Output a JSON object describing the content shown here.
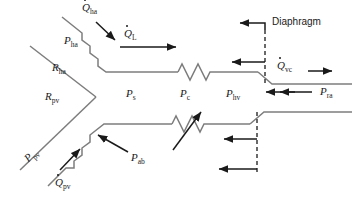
{
  "figure": {
    "background": "#ffffff",
    "line_color": "#7d7d7d",
    "arrow_color": "#1a1a1a",
    "text_color": "#1a1a1a"
  },
  "labels": {
    "q_ha": {
      "symbol": "Q",
      "sub": "ha",
      "dot": true,
      "x": 82,
      "y": 4
    },
    "p_ha": {
      "symbol": "P",
      "sub": "ha",
      "dot": false,
      "x": 66,
      "y": 38
    },
    "r_ha": {
      "symbol": "R",
      "sub": "ha",
      "dot": false,
      "x": 54,
      "y": 64
    },
    "r_pv": {
      "symbol": "R",
      "sub": "pv",
      "dot": false,
      "x": 47,
      "y": 92
    },
    "p_pv": {
      "symbol": "P",
      "sub": "pv",
      "dot": false,
      "x": 22,
      "y": 160
    },
    "q_pv": {
      "symbol": "Q",
      "sub": "pv",
      "dot": true,
      "x": 56,
      "y": 173
    },
    "q_l": {
      "symbol": "Q",
      "sub": "L",
      "dot": true,
      "x": 124,
      "y": 31
    },
    "p_s": {
      "symbol": "P",
      "sub": "s",
      "dot": false,
      "x": 126,
      "y": 90
    },
    "p_c": {
      "symbol": "P",
      "sub": "c",
      "dot": false,
      "x": 180,
      "y": 90
    },
    "p_ab": {
      "symbol": "P",
      "sub": "ab",
      "dot": false,
      "x": 130,
      "y": 150
    },
    "p_hv": {
      "symbol": "P",
      "sub": "hv",
      "dot": false,
      "x": 226,
      "y": 90
    },
    "p_ra": {
      "symbol": "P",
      "sub": "ra",
      "dot": false,
      "x": 320,
      "y": 89
    },
    "q_vc": {
      "symbol": "Q",
      "sub": "vc",
      "dot": true,
      "x": 277,
      "y": 60
    },
    "diaphragm": {
      "text": "Diaphragm",
      "x": 272,
      "y": 20
    }
  },
  "icons": {
    "resistor_upper": "resistor-zigzag-icon",
    "resistor_lower": "resistor-zigzag-icon",
    "diaphragm_dashed": "dashed-diaphragm-icon"
  },
  "flows": [
    {
      "name": "q-ha-arrow",
      "direction": "down-right",
      "label": "Q̇ ha"
    },
    {
      "name": "q-l-arrow",
      "direction": "right",
      "label": "Q̇ L"
    },
    {
      "name": "q-vc-arrow",
      "direction": "right",
      "label": "Q̇ vc"
    },
    {
      "name": "q-pv-arrow",
      "direction": "up-right",
      "label": "Q̇ pv"
    },
    {
      "name": "p-ra-arrow",
      "direction": "left",
      "label": "P ra"
    },
    {
      "name": "diaphragm-arrow-top",
      "direction": "left",
      "label": "Diaphragm"
    },
    {
      "name": "diaphragm-arrow-mid",
      "direction": "left",
      "label": ""
    },
    {
      "name": "diaphragm-arrow-lower-1",
      "direction": "left",
      "label": ""
    },
    {
      "name": "diaphragm-arrow-lower-2",
      "direction": "left",
      "label": ""
    },
    {
      "name": "p-ab-arrow-left",
      "direction": "up-left",
      "label": "P ab"
    },
    {
      "name": "p-ab-arrow-right",
      "direction": "up-right",
      "label": "P ab"
    }
  ]
}
